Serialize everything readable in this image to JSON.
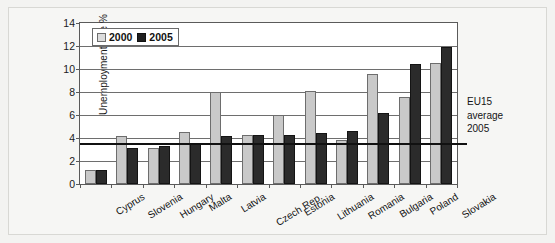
{
  "chart_data": {
    "type": "bar",
    "title": "",
    "xlabel": "",
    "ylabel": "Unemployment rate %",
    "ylim": [
      0,
      14
    ],
    "yticks": [
      "0",
      "2",
      "4",
      "6",
      "8",
      "10",
      "12",
      "14"
    ],
    "grid": true,
    "legend_position": "top-left",
    "categories": [
      "Cyprus",
      "Slovenia",
      "Hungary",
      "Malta",
      "Latvia",
      "Czech Rep.",
      "Estonia",
      "Lithuania",
      "Romania",
      "Bulgaria",
      "Poland",
      "Slovakia"
    ],
    "series": [
      {
        "name": "2000",
        "color": "#c9c9c9",
        "values": [
          1.2,
          4.2,
          3.1,
          4.5,
          8.0,
          4.3,
          6.0,
          8.1,
          3.8,
          9.6,
          7.6,
          10.5
        ]
      },
      {
        "name": "2005",
        "color": "#2b2b2b",
        "values": [
          1.2,
          3.1,
          3.3,
          3.5,
          4.2,
          4.3,
          4.3,
          4.4,
          4.6,
          6.2,
          10.4,
          11.9
        ]
      }
    ],
    "reference_line": {
      "label": "EU15 average 2005",
      "value": 3.6,
      "color": "#111111"
    },
    "annotation": {
      "line1": "EU15",
      "line2": "average",
      "line3": "2005"
    }
  }
}
